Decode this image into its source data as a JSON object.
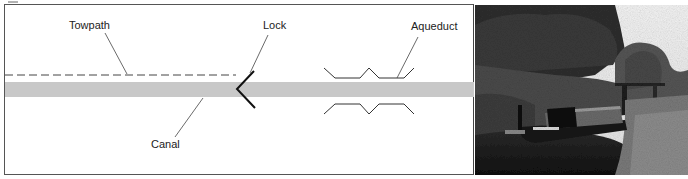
{
  "figure": {
    "diagram": {
      "labels": {
        "towpath": "Towpath",
        "canal": "Canal",
        "lock": "Lock",
        "aqueduct": "Aqueduct"
      },
      "colors": {
        "canal_fill": "#c8c8c8",
        "line": "#333333",
        "lock_stroke": "#111111",
        "border": "#555555"
      },
      "elements": [
        "towpath (dashed line)",
        "canal (gray band)",
        "lock (chevron)",
        "aqueduct (zigzag walls)"
      ]
    },
    "photo": {
      "description": "Black and white photograph of a narrowboat moored at a canal lock surrounded by trees and vegetation",
      "boat_name": "THE LAUREL"
    }
  }
}
